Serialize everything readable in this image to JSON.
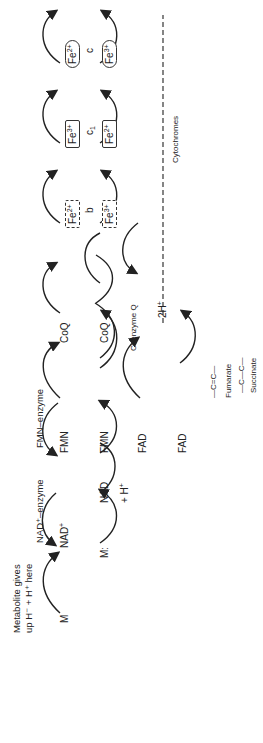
{
  "labels": {
    "metabolite_note_line1": "Metabolite gives",
    "metabolite_note_line2": "up H⁻ + H⁺ here",
    "nad_enzyme": "NAD⁺–enzyme",
    "fmn_enzyme": "FMN–enzyme",
    "coenzyme_q": "Coenzyme Q",
    "cytochromes": "Cytochromes",
    "pieces_line1": "Pieces of",
    "pieces_line2": "hydrogen",
    "pieces_line3": "delivered to",
    "pieces_line4": "oxygen here",
    "fumarate": "Fumarate",
    "succinate": "Succinate"
  },
  "species": {
    "mh": "M",
    "m": "M:",
    "nad_plus": "NAD",
    "nadh": "NAD",
    "plus_h": "+ H",
    "fmnh": "FMN",
    "fmn": "FMN",
    "fadh": "FAD",
    "fad": "FAD",
    "coq": "CoQ",
    "coqh": "CoQ",
    "two_h_plus_left": "2H",
    "two_h_plus_right": "2H",
    "water": "O",
    "oxygen": "½·O:O·"
  },
  "cytochromes": [
    {
      "name": "b",
      "top": "Fe",
      "top_charge": "2+",
      "bottom": "Fe",
      "bottom_charge": "3+",
      "coef": "2",
      "style": "dash"
    },
    {
      "name": "c",
      "sub": "1",
      "top": "Fe",
      "top_charge": "3+",
      "bottom": "Fe",
      "bottom_charge": "2+",
      "coef": "2",
      "style": "solid"
    },
    {
      "name": "c",
      "top": "Fe",
      "top_charge": "2+",
      "bottom": "Fe",
      "bottom_charge": "3+",
      "coef": "2",
      "style": "round"
    },
    {
      "name": "a,a",
      "sub": "3",
      "top": "Fe",
      "top_charge": "3+",
      "bottom": "Fe",
      "bottom_charge": "2+",
      "coef": "2",
      "style": "solid"
    }
  ],
  "fumarate_structure": "—C=C—",
  "succinate_structure": "—C—C—"
}
